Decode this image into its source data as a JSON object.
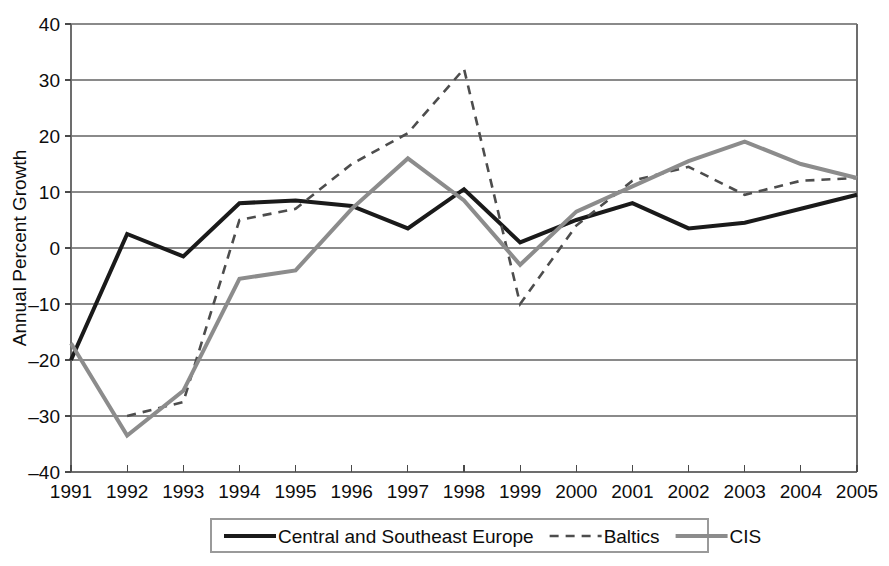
{
  "chart_data": {
    "type": "line",
    "title": "",
    "xlabel": "",
    "ylabel": "Annual Percent Growth",
    "categories": [
      "1991",
      "1992",
      "1993",
      "1994",
      "1995",
      "1996",
      "1997",
      "1998",
      "1999",
      "2000",
      "2001",
      "2002",
      "2003",
      "2004",
      "2005"
    ],
    "x_tick_labels": [
      "1991",
      "1992",
      "1993",
      "1994",
      "1995",
      "1996",
      "1997",
      "1998",
      "1999",
      "2000",
      "2001",
      "2002",
      "2003",
      "2004",
      "2005"
    ],
    "y_tick_labels": [
      "40",
      "30",
      "20",
      "10",
      "0",
      "–10",
      "–20",
      "–30",
      "–40"
    ],
    "y_ticks": [
      40,
      30,
      20,
      10,
      0,
      -10,
      -20,
      -30,
      -40
    ],
    "ylim": [
      -40,
      40
    ],
    "xlim": [
      "1991",
      "2005"
    ],
    "grid": "horizontal",
    "legend_position": "bottom-center",
    "series": [
      {
        "name": "Central and Southeast Europe",
        "style": "solid",
        "color": "#1a1a1a",
        "width": 4,
        "values": [
          -20,
          2.5,
          -1.5,
          8,
          8.5,
          7.5,
          3.5,
          10.5,
          1,
          5,
          8,
          3.5,
          4.5,
          7,
          9.5
        ]
      },
      {
        "name": "Baltics",
        "style": "dashed",
        "color": "#4d4d4d",
        "width": 2.6,
        "values": [
          null,
          -30,
          -27.5,
          5,
          7,
          15,
          20.5,
          32,
          -10,
          4,
          12,
          14.5,
          9.5,
          12,
          12.5
        ]
      },
      {
        "name": "CIS",
        "style": "solid",
        "color": "#8c8c8c",
        "width": 4,
        "values": [
          -17,
          -33.5,
          -25.5,
          -5.5,
          -4,
          7,
          16,
          8.5,
          -3,
          6.5,
          11,
          15.5,
          19,
          15,
          12.5
        ]
      }
    ]
  },
  "legend": {
    "items": [
      {
        "label": "Central and Southeast Europe",
        "style": "solid",
        "color": "#1a1a1a"
      },
      {
        "label": "Baltics",
        "style": "dashed",
        "color": "#4d4d4d"
      },
      {
        "label": "CIS",
        "style": "solid",
        "color": "#8c8c8c"
      }
    ]
  },
  "axes": {
    "y_title": "Annual Percent Growth"
  }
}
